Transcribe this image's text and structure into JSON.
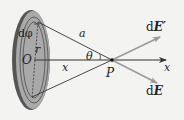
{
  "diagram": {
    "type": "physics-charged-disk-field",
    "labels": {
      "d_phi": "dφ",
      "r": "r",
      "origin": "O",
      "a": "a",
      "theta": "θ",
      "x_distance": "x",
      "point": "P",
      "axis": "x",
      "dE_prime_d": "d",
      "dE_prime_E": "E′",
      "dE_d": "d",
      "dE_E": "E"
    },
    "colors": {
      "background": "#f3f3f1",
      "disk_fill": "#a9a9a9",
      "disk_edge": "#555555",
      "ring_lines": "#4a4a4a",
      "lines": "#333333",
      "field_arrows": "#9a9a9a",
      "axis": "#333333"
    }
  }
}
